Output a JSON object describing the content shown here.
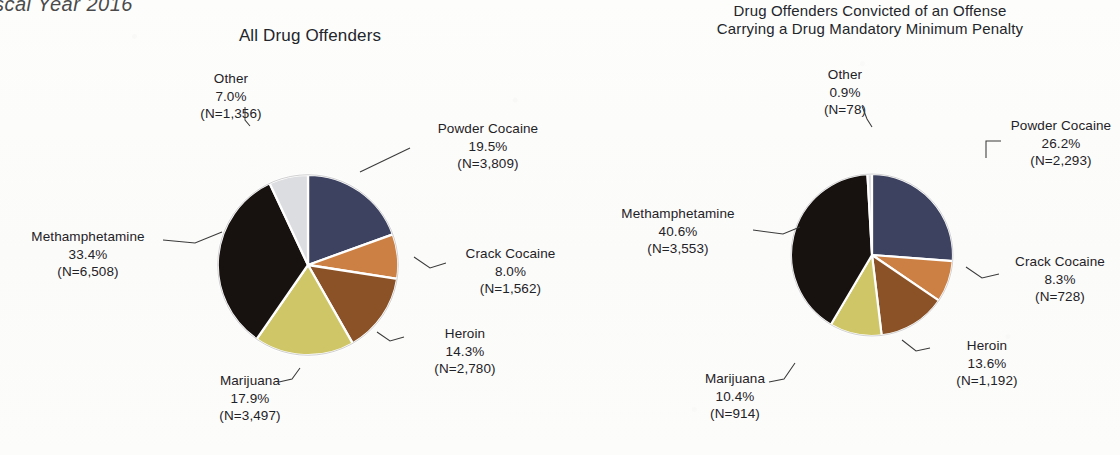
{
  "document": {
    "running_header": "scal Year 2016"
  },
  "charts": [
    {
      "id": "all-drug-offenders",
      "title": "All Drug Offenders",
      "title_line1": "All Drug Offenders",
      "title_line2": ""
    },
    {
      "id": "mandatory-minimum",
      "title": "Drug Offenders Convicted of an Offense Carrying a Drug Mandatory Minimum Penalty",
      "title_line1": "Drug Offenders Convicted of an Offense",
      "title_line2": "Carrying a Drug Mandatory Minimum Penalty"
    }
  ],
  "labels": {
    "left": {
      "other": {
        "name": "Other",
        "pct": "7.0%",
        "n": "(N=1,356)"
      },
      "powder": {
        "name": "Powder Cocaine",
        "pct": "19.5%",
        "n": "(N=3,809)"
      },
      "crack": {
        "name": "Crack Cocaine",
        "pct": "8.0%",
        "n": "(N=1,562)"
      },
      "heroin": {
        "name": "Heroin",
        "pct": "14.3%",
        "n": "(N=2,780)"
      },
      "mj": {
        "name": "Marijuana",
        "pct": "17.9%",
        "n": "(N=3,497)"
      },
      "meth": {
        "name": "Methamphetamine",
        "pct": "33.4%",
        "n": "(N=6,508)"
      }
    },
    "right": {
      "other": {
        "name": "Other",
        "pct": "0.9%",
        "n": "(N=78)"
      },
      "powder": {
        "name": "Powder Cocaine",
        "pct": "26.2%",
        "n": "(N=2,293)"
      },
      "crack": {
        "name": "Crack Cocaine",
        "pct": "8.3%",
        "n": "(N=728)"
      },
      "heroin": {
        "name": "Heroin",
        "pct": "13.6%",
        "n": "(N=1,192)"
      },
      "mj": {
        "name": "Marijuana",
        "pct": "10.4%",
        "n": "(N=914)"
      },
      "meth": {
        "name": "Methamphetamine",
        "pct": "40.6%",
        "n": "(N=3,553)"
      }
    }
  },
  "palette": {
    "powder_cocaine": "#3d4260",
    "crack_cocaine": "#cc8044",
    "heroin": "#8a5226",
    "marijuana": "#cfc667",
    "methamphetamine": "#17120f",
    "other": "#dcdde0",
    "slice_edge": "#ffffff",
    "leader_line": "#3a3a3a",
    "text": "#1f2226"
  },
  "chart_data": [
    {
      "type": "pie",
      "title": "All Drug Offenders",
      "categories": [
        "Powder Cocaine",
        "Crack Cocaine",
        "Heroin",
        "Marijuana",
        "Methamphetamine",
        "Other"
      ],
      "values": [
        19.5,
        8.0,
        14.3,
        17.9,
        33.4,
        7.0
      ],
      "counts": [
        3809,
        1562,
        2780,
        3497,
        6508,
        1356
      ],
      "value_unit": "percent",
      "data_labels": [
        "Powder Cocaine 19.5% (N=3,809)",
        "Crack Cocaine 8.0% (N=1,562)",
        "Heroin 14.3% (N=2,780)",
        "Marijuana 17.9% (N=3,497)",
        "Methamphetamine 33.4% (N=6,508)",
        "Other 7.0% (N=1,356)"
      ],
      "colors": [
        "#3d4260",
        "#cc8044",
        "#8a5226",
        "#cfc667",
        "#17120f",
        "#dcdde0"
      ],
      "start_angle_deg": 0,
      "direction": "clockwise",
      "legend": "none",
      "grid": false,
      "total_n": 19512
    },
    {
      "type": "pie",
      "title": "Drug Offenders Convicted of an Offense Carrying a Drug Mandatory Minimum Penalty",
      "categories": [
        "Powder Cocaine",
        "Crack Cocaine",
        "Heroin",
        "Marijuana",
        "Methamphetamine",
        "Other"
      ],
      "values": [
        26.2,
        8.3,
        13.6,
        10.4,
        40.6,
        0.9
      ],
      "counts": [
        2293,
        728,
        1192,
        914,
        3553,
        78
      ],
      "value_unit": "percent",
      "data_labels": [
        "Powder Cocaine 26.2% (N=2,293)",
        "Crack Cocaine 8.3% (N=728)",
        "Heroin 13.6% (N=1,192)",
        "Marijuana 10.4% (N=914)",
        "Methamphetamine 40.6% (N=3,553)",
        "Other 0.9% (N=78)"
      ],
      "colors": [
        "#3d4260",
        "#cc8044",
        "#8a5226",
        "#cfc667",
        "#17120f",
        "#dcdde0"
      ],
      "start_angle_deg": 0,
      "direction": "clockwise",
      "legend": "none",
      "grid": false,
      "total_n": 8758
    }
  ]
}
